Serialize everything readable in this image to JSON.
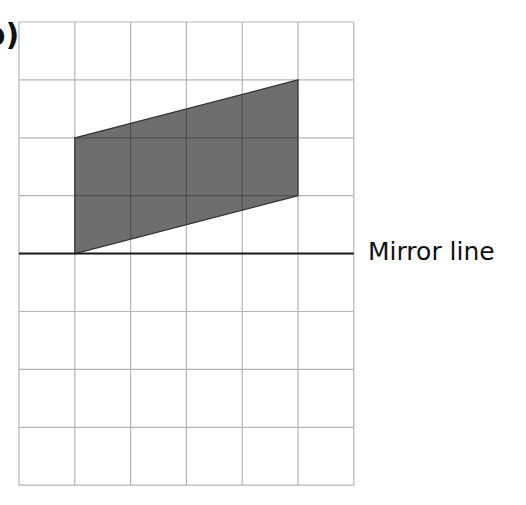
{
  "question": {
    "part_label": "b)"
  },
  "grid": {
    "columns": 6,
    "rows": 8,
    "origin_px": [
      19,
      22
    ],
    "cell_width_px": 55.8,
    "cell_height_px": 57.9,
    "line_color": "#b5b5b5"
  },
  "shape": {
    "type": "parallelogram",
    "fill_color": "#6e6e6e",
    "stroke_color": "#333333",
    "vertices_grid": [
      [
        1,
        2
      ],
      [
        5,
        1
      ],
      [
        5,
        3
      ],
      [
        1,
        4
      ]
    ]
  },
  "mirror_line": {
    "label": "Mirror line",
    "grid_row": 4,
    "color": "#1a1a1a"
  }
}
